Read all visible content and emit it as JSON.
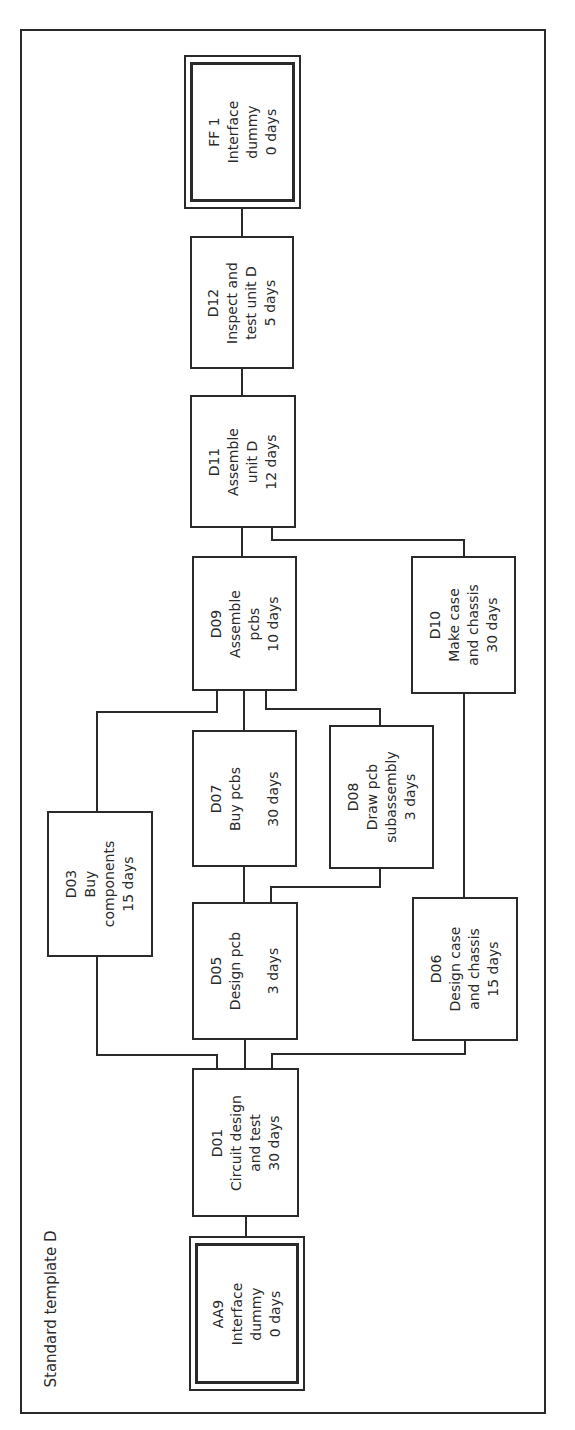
{
  "diagram": {
    "title": "Standard template D",
    "type": "precedence network (activity-on-node)",
    "orientation": "rotated 90° counter-clockwise",
    "line_color": "#2a2a2a",
    "nodes": [
      {
        "id": "AA9",
        "lines": [
          "AA9",
          "Interface",
          "dummy",
          "0 days"
        ],
        "name": "Interface dummy",
        "duration": "0 days",
        "style": "double"
      },
      {
        "id": "D01",
        "lines": [
          "D01",
          "Circuit design",
          "and test",
          "30 days"
        ],
        "name": "Circuit design and test",
        "duration": "30 days",
        "style": "single"
      },
      {
        "id": "D03",
        "lines": [
          "D03",
          "Buy",
          "components",
          "15 days"
        ],
        "name": "Buy components",
        "duration": "15 days",
        "style": "single"
      },
      {
        "id": "D05",
        "lines": [
          "D05",
          "Design pcb",
          "",
          "3 days"
        ],
        "name": "Design pcb",
        "duration": "3 days",
        "style": "single"
      },
      {
        "id": "D06",
        "lines": [
          "D06",
          "Design case",
          "and chassis",
          "15 days"
        ],
        "name": "Design case and chassis",
        "duration": "15 days",
        "style": "single"
      },
      {
        "id": "D07",
        "lines": [
          "D07",
          "Buy pcbs",
          "",
          "30 days"
        ],
        "name": "Buy pcbs",
        "duration": "30 days",
        "style": "single"
      },
      {
        "id": "D08",
        "lines": [
          "D08",
          "Draw pcb",
          "subassembly",
          "3 days"
        ],
        "name": "Draw pcb subassembly",
        "duration": "3 days",
        "style": "single"
      },
      {
        "id": "D09",
        "lines": [
          "D09",
          "Assemble",
          "pcbs",
          "10 days"
        ],
        "name": "Assemble pcbs",
        "duration": "10 days",
        "style": "single"
      },
      {
        "id": "D10",
        "lines": [
          "D10",
          "Make case",
          "and chassis",
          "30 days"
        ],
        "name": "Make case and chassis",
        "duration": "30 days",
        "style": "single"
      },
      {
        "id": "D11",
        "lines": [
          "D11",
          "Assemble",
          "unit D",
          "12 days"
        ],
        "name": "Assemble unit D",
        "duration": "12 days",
        "style": "single"
      },
      {
        "id": "D12",
        "lines": [
          "D12",
          "Inspect and",
          "test unit D",
          "5 days"
        ],
        "name": "Inspect and test unit D",
        "duration": "5 days",
        "style": "single"
      },
      {
        "id": "FF1",
        "lines": [
          "FF 1",
          "Interface",
          "dummy",
          "0 days"
        ],
        "name": "Interface dummy",
        "duration": "0 days",
        "style": "double"
      }
    ],
    "edges": [
      [
        "AA9",
        "D01"
      ],
      [
        "D01",
        "D03"
      ],
      [
        "D01",
        "D05"
      ],
      [
        "D01",
        "D06"
      ],
      [
        "D05",
        "D07"
      ],
      [
        "D05",
        "D08"
      ],
      [
        "D06",
        "D10"
      ],
      [
        "D03",
        "D09"
      ],
      [
        "D07",
        "D09"
      ],
      [
        "D08",
        "D09"
      ],
      [
        "D09",
        "D11"
      ],
      [
        "D10",
        "D11"
      ],
      [
        "D11",
        "D12"
      ],
      [
        "D12",
        "FF1"
      ]
    ]
  }
}
